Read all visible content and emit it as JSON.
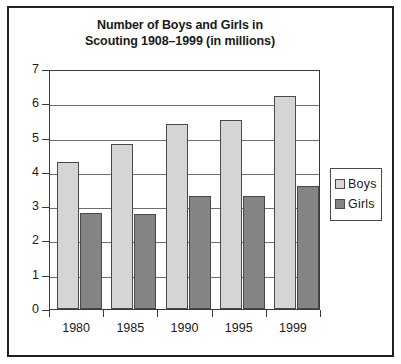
{
  "figure": {
    "title_line1": "Number of Boys and Girls in",
    "title_line2": "Scouting 1908–1999 (in millions)"
  },
  "legend": {
    "position": "right",
    "items": [
      {
        "label": "Boys",
        "color": "#d5d5d5"
      },
      {
        "label": "Girls",
        "color": "#848484"
      }
    ]
  },
  "axes": {
    "y_ticks": [
      "7",
      "6",
      "5",
      "4",
      "3",
      "2",
      "1",
      "0"
    ],
    "x_ticks": [
      "1980",
      "1985",
      "1990",
      "1995",
      "1999"
    ]
  },
  "chart_data": {
    "type": "bar",
    "title": "Number of Boys and Girls in Scouting 1908–1999 (in millions)",
    "xlabel": "",
    "ylabel": "",
    "ylim": [
      0,
      7
    ],
    "ytick_step": 1,
    "grid": true,
    "legend_position": "right",
    "categories": [
      "1980",
      "1985",
      "1990",
      "1995",
      "1999"
    ],
    "series": [
      {
        "name": "Boys",
        "color": "#d5d5d5",
        "values": [
          4.3,
          4.8,
          5.4,
          5.5,
          6.2
        ]
      },
      {
        "name": "Girls",
        "color": "#848484",
        "values": [
          2.8,
          2.78,
          3.3,
          3.3,
          3.6
        ]
      }
    ]
  }
}
